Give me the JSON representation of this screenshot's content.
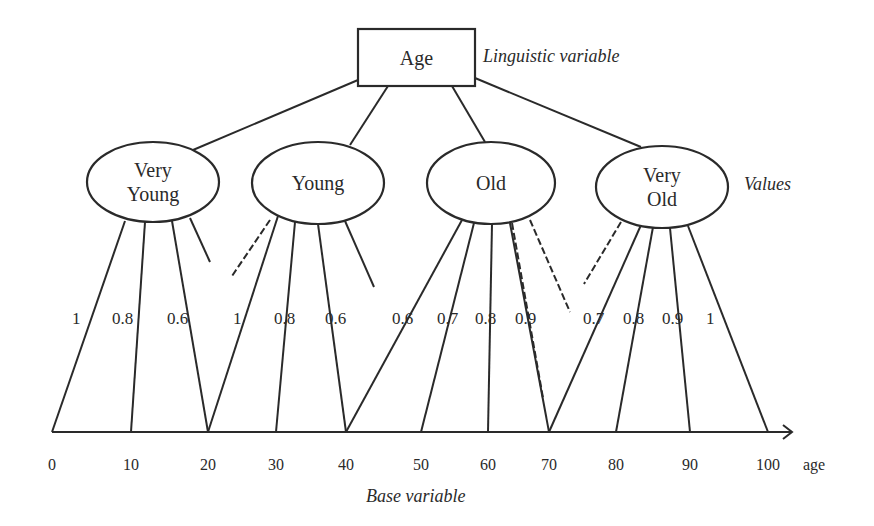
{
  "root": {
    "label": "Age",
    "annotation": "Linguistic variable",
    "x": 358,
    "y": 29,
    "w": 117,
    "h": 57
  },
  "values_annotation": "Values",
  "base_annotation": "Base variable",
  "axis": {
    "unit_label": "age",
    "y": 432,
    "x_start": 52,
    "x_end": 792,
    "ticks": [
      {
        "label": "0",
        "x": 52
      },
      {
        "label": "10",
        "x": 131
      },
      {
        "label": "20",
        "x": 208
      },
      {
        "label": "30",
        "x": 276
      },
      {
        "label": "40",
        "x": 346
      },
      {
        "label": "50",
        "x": 421
      },
      {
        "label": "60",
        "x": 488
      },
      {
        "label": "70",
        "x": 549
      },
      {
        "label": "80",
        "x": 616
      },
      {
        "label": "90",
        "x": 690
      },
      {
        "label": "100",
        "x": 768
      }
    ]
  },
  "values": [
    {
      "id": "very-young",
      "lines": [
        "Very",
        "Young"
      ],
      "cx": 153,
      "cy": 182,
      "rx": 66,
      "ry": 40,
      "root_attach": [
        358,
        80
      ],
      "top_attach": [
        193,
        150
      ],
      "memberships": [
        {
          "age": 0,
          "grade": "1",
          "from": [
            125,
            221
          ],
          "label_x": 72,
          "dashed": false
        },
        {
          "age": 10,
          "grade": "0.8",
          "from": [
            145,
            222
          ],
          "label_x": 112,
          "dashed": false
        },
        {
          "age": 20,
          "grade": "0.6",
          "from": [
            172,
            221
          ],
          "label_x": 167,
          "dashed": false
        }
      ],
      "stubs": [
        {
          "from": [
            190,
            218
          ],
          "to": [
            210,
            262
          ]
        }
      ]
    },
    {
      "id": "young",
      "lines": [
        "Young"
      ],
      "cx": 318,
      "cy": 183,
      "rx": 66,
      "ry": 41,
      "root_attach": [
        388,
        86
      ],
      "top_attach": [
        350,
        145
      ],
      "memberships": [
        {
          "age": 20,
          "grade": "1",
          "from": [
            278,
            216
          ],
          "label_x": 233,
          "dashed": false
        },
        {
          "age": 30,
          "grade": "0.8",
          "from": [
            295,
            222
          ],
          "label_x": 274,
          "dashed": false
        },
        {
          "age": 40,
          "grade": "0.6",
          "from": [
            318,
            224
          ],
          "label_x": 325,
          "dashed": false
        }
      ],
      "stubs": [
        {
          "from": [
            270,
            220
          ],
          "to": [
            232,
            276
          ],
          "dashed": true
        },
        {
          "from": [
            345,
            221
          ],
          "to": [
            374,
            287
          ]
        }
      ]
    },
    {
      "id": "old",
      "lines": [
        "Old"
      ],
      "cx": 491,
      "cy": 183,
      "rx": 64,
      "ry": 41,
      "root_attach": [
        452,
        86
      ],
      "top_attach": [
        485,
        142
      ],
      "memberships": [
        {
          "age": 40,
          "grade": "0.6",
          "from": [
            462,
            220
          ],
          "label_x": 392,
          "dashed": false
        },
        {
          "age": 50,
          "grade": "0.7",
          "from": [
            474,
            223
          ],
          "label_x": 437,
          "dashed": false
        },
        {
          "age": 60,
          "grade": "0.8",
          "from": [
            492,
            224
          ],
          "label_x": 475,
          "dashed": false
        },
        {
          "age": 70,
          "grade": "0.9",
          "from": [
            510,
            223
          ],
          "label_x": 515,
          "dashed": false
        }
      ],
      "stubs": [
        {
          "from": [
            512,
            223
          ],
          "to": [
            543,
            398
          ],
          "dashed": true
        },
        {
          "from": [
            530,
            220
          ],
          "to": [
            570,
            312
          ],
          "dashed": true
        }
      ]
    },
    {
      "id": "very-old",
      "lines": [
        "Very",
        "Old"
      ],
      "cx": 662,
      "cy": 187,
      "rx": 66,
      "ry": 41,
      "root_attach": [
        475,
        78
      ],
      "top_attach": [
        641,
        147
      ],
      "memberships": [
        {
          "age": 70,
          "grade": "0.7",
          "from": [
            641,
            225
          ],
          "label_x": 583,
          "dashed": false
        },
        {
          "age": 80,
          "grade": "0.8",
          "from": [
            653,
            227
          ],
          "label_x": 623,
          "dashed": false
        },
        {
          "age": 90,
          "grade": "0.9",
          "from": [
            670,
            228
          ],
          "label_x": 662,
          "dashed": false
        },
        {
          "age": 100,
          "grade": "1",
          "from": [
            688,
            226
          ],
          "label_x": 706,
          "dashed": false
        }
      ],
      "stubs": [
        {
          "from": [
            621,
            222
          ],
          "to": [
            584,
            284
          ],
          "dashed": true
        }
      ]
    }
  ],
  "membership_label_y": 324
}
